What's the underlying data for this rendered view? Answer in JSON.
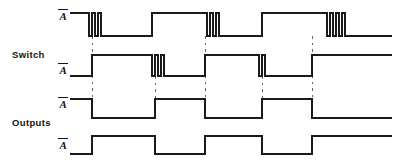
{
  "figure": {
    "width": 398,
    "height": 164,
    "background": "#ffffff",
    "stroke_color": "#1a1a1a",
    "guide_color": "#555555"
  },
  "groups": [
    {
      "name": "switch-group",
      "label": "Switch",
      "x": 12,
      "y": 49
    },
    {
      "name": "outputs-group",
      "label": "Outputs",
      "x": 12,
      "y": 117
    }
  ],
  "signals": [
    {
      "name": "switch-a-bar",
      "label": "A",
      "overbar": true,
      "label_x": 58,
      "label_y": 9,
      "group": "Switch",
      "row": 1,
      "high_y": 13,
      "low_y": 36,
      "start_x": 70,
      "end_x": 392,
      "description": "Switch contact A-bar with contact bounce on each opening transition",
      "segments": "high from 70, bounce at 89, low to 152, high 152-210, bounce at 210, low to 262, high 262-330, bounce at 330, low to 392"
    },
    {
      "name": "switch-a-bar-2",
      "label": "A",
      "overbar": true,
      "label_x": 58,
      "label_y": 63,
      "group": "Switch",
      "row": 2,
      "high_y": 55,
      "low_y": 76,
      "start_x": 70,
      "end_x": 392,
      "description": "Complementary switch contact with bounce on its own closing transitions",
      "segments": "low from 70, rise at 92, high to 155, bounce at 155, low to 205, high 205-262, bounce at 262, low to 312, high 312-392"
    },
    {
      "name": "output-a",
      "label": "A",
      "overbar": true,
      "label_x": 58,
      "label_y": 97,
      "group": "Outputs",
      "row": 3,
      "high_y": 99,
      "low_y": 118,
      "start_x": 70,
      "end_x": 392,
      "description": "Debounced latch output A - clean square wave, no bounce",
      "segments": "high 70-92, low 92-155, high 155-205, low 205-262, high 262-312, low 312-392"
    },
    {
      "name": "output-a-bar",
      "label": "A",
      "overbar": true,
      "label_x": 58,
      "label_y": 138,
      "group": "Outputs",
      "row": 4,
      "high_y": 136,
      "low_y": 154,
      "start_x": 70,
      "end_x": 392,
      "description": "Debounced latch output A-bar - complement of output A",
      "segments": "low 70-92, high 92-155, low 155-205, high 205-262, low 262-312, high 312-392"
    }
  ],
  "transitions": [
    {
      "name": "transition-1",
      "x": 92,
      "label": "t1"
    },
    {
      "name": "transition-2",
      "x": 155,
      "label": "t2"
    },
    {
      "name": "transition-3",
      "x": 205,
      "label": "t3"
    },
    {
      "name": "transition-4",
      "x": 262,
      "label": "t4"
    },
    {
      "name": "transition-5",
      "x": 312,
      "label": "t5"
    }
  ],
  "bounce_groups": [
    {
      "name": "bounce-1",
      "signal": "switch-a-bar",
      "x": 89,
      "pulses": 2,
      "width": 3,
      "gap": 4
    },
    {
      "name": "bounce-2",
      "signal": "switch-a-bar-2",
      "x": 155,
      "pulses": 2,
      "width": 3,
      "gap": 4
    },
    {
      "name": "bounce-3",
      "signal": "switch-a-bar",
      "x": 205,
      "pulses": 2,
      "width": 3,
      "gap": 4
    },
    {
      "name": "bounce-4",
      "signal": "switch-a-bar-2",
      "x": 262,
      "pulses": 1,
      "width": 3,
      "gap": 4
    },
    {
      "name": "bounce-5",
      "signal": "switch-a-bar",
      "x": 312,
      "pulses": 3,
      "width": 3,
      "gap": 4
    }
  ],
  "chart_data": {
    "type": "line",
    "xlabel": "Time",
    "ylabel": "Logic level",
    "grid": false,
    "legend": "none",
    "xlim": [
      70,
      392
    ],
    "series": [
      {
        "name": "Switch A-bar",
        "values": [
          [
            70,
            1
          ],
          [
            89,
            1
          ],
          [
            89,
            0
          ],
          [
            92,
            0
          ],
          [
            92,
            1
          ],
          [
            95,
            1
          ],
          [
            95,
            0
          ],
          [
            98,
            0
          ],
          [
            98,
            1
          ],
          [
            101,
            1
          ],
          [
            101,
            0
          ],
          [
            152,
            0
          ],
          [
            152,
            1
          ],
          [
            207,
            1
          ],
          [
            207,
            0
          ],
          [
            210,
            0
          ],
          [
            210,
            1
          ],
          [
            213,
            1
          ],
          [
            213,
            0
          ],
          [
            216,
            0
          ],
          [
            216,
            1
          ],
          [
            219,
            1
          ],
          [
            219,
            0
          ],
          [
            262,
            0
          ],
          [
            262,
            1
          ],
          [
            327,
            1
          ],
          [
            327,
            0
          ],
          [
            330,
            0
          ],
          [
            330,
            1
          ],
          [
            333,
            1
          ],
          [
            333,
            0
          ],
          [
            336,
            0
          ],
          [
            336,
            1
          ],
          [
            339,
            1
          ],
          [
            339,
            0
          ],
          [
            342,
            0
          ],
          [
            342,
            1
          ],
          [
            345,
            1
          ],
          [
            345,
            0
          ],
          [
            392,
            0
          ]
        ]
      },
      {
        "name": "Switch A-bar complement",
        "values": [
          [
            70,
            0
          ],
          [
            92,
            0
          ],
          [
            92,
            1
          ],
          [
            152,
            1
          ],
          [
            152,
            0
          ],
          [
            155,
            0
          ],
          [
            155,
            1
          ],
          [
            158,
            1
          ],
          [
            158,
            0
          ],
          [
            161,
            0
          ],
          [
            161,
            1
          ],
          [
            164,
            1
          ],
          [
            164,
            0
          ],
          [
            205,
            0
          ],
          [
            205,
            1
          ],
          [
            259,
            1
          ],
          [
            259,
            0
          ],
          [
            262,
            0
          ],
          [
            262,
            1
          ],
          [
            265,
            1
          ],
          [
            265,
            0
          ],
          [
            312,
            0
          ],
          [
            312,
            1
          ],
          [
            392,
            1
          ]
        ]
      },
      {
        "name": "Output A",
        "values": [
          [
            70,
            1
          ],
          [
            92,
            1
          ],
          [
            92,
            0
          ],
          [
            155,
            0
          ],
          [
            155,
            1
          ],
          [
            205,
            1
          ],
          [
            205,
            0
          ],
          [
            262,
            0
          ],
          [
            262,
            1
          ],
          [
            312,
            1
          ],
          [
            312,
            0
          ],
          [
            392,
            0
          ]
        ]
      },
      {
        "name": "Output A-bar",
        "values": [
          [
            70,
            0
          ],
          [
            92,
            0
          ],
          [
            92,
            1
          ],
          [
            155,
            1
          ],
          [
            155,
            0
          ],
          [
            205,
            0
          ],
          [
            205,
            1
          ],
          [
            262,
            1
          ],
          [
            262,
            0
          ],
          [
            312,
            0
          ],
          [
            312,
            1
          ],
          [
            392,
            1
          ]
        ]
      }
    ]
  }
}
